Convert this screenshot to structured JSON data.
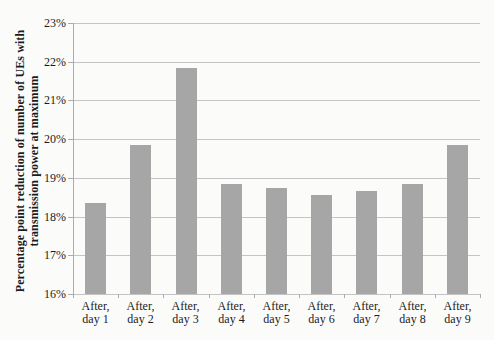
{
  "chart_data": {
    "type": "bar",
    "title": "",
    "ylabel_lines": [
      "Percentage point reduction of number of UEs with",
      "transmission power at maximum"
    ],
    "xlabel": "",
    "categories": [
      [
        "After,",
        "day 1"
      ],
      [
        "After,",
        "day 2"
      ],
      [
        "After,",
        "day 3"
      ],
      [
        "After,",
        "day 4"
      ],
      [
        "After,",
        "day 5"
      ],
      [
        "After,",
        "day 6"
      ],
      [
        "After,",
        "day 7"
      ],
      [
        "After,",
        "day 8"
      ],
      [
        "After,",
        "day 9"
      ]
    ],
    "values": [
      18.35,
      19.85,
      21.85,
      18.85,
      18.75,
      18.55,
      18.65,
      18.85,
      19.85
    ],
    "ytick_labels": [
      "23%",
      "22%",
      "21%",
      "20%",
      "19%",
      "18%",
      "17%",
      "16%"
    ],
    "ytick_values": [
      23,
      22,
      21,
      20,
      19,
      18,
      17,
      16
    ],
    "ylim": [
      16,
      23
    ],
    "grid": "horizontal",
    "legend": "none",
    "bar_color": "#a6a6a6",
    "gridline_color": "#c4c4c4",
    "axis_color": "#acacac",
    "text_color": "#1c1c1c",
    "background_color": "#fbfbfa"
  }
}
